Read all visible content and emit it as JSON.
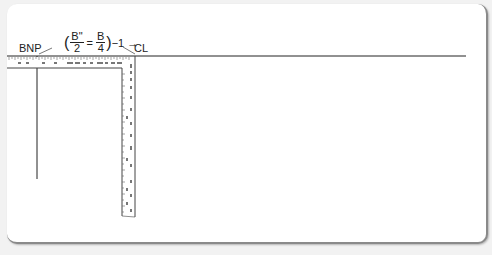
{
  "diagram": {
    "type": "pattern-drafting L-square ruler diagram",
    "labels": {
      "bnp": "BNP",
      "cl": "CL"
    },
    "formula": {
      "open_paren": "(",
      "frac1_num": "B\"",
      "frac1_den": "2",
      "equals": "=",
      "frac2_num": "B",
      "frac2_den": "4",
      "close_paren": ")",
      "suffix": "−1",
      "arrow": "→"
    },
    "colors": {
      "line": "#222222",
      "ruler_fill": "#ffffff",
      "tick": "#555555",
      "card_bg": "#ffffff",
      "page_bg": "#f2f2f2",
      "card_border": "#8a8a8a"
    }
  }
}
